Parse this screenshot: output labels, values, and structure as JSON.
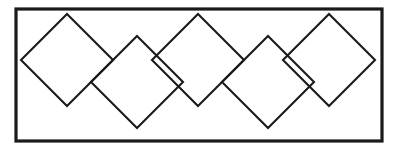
{
  "figure": {
    "canvas": {
      "width": 394,
      "height": 152,
      "background": "#ffffff"
    },
    "colors": {
      "stroke": "#1a1a1a",
      "fill": "#ffffff",
      "background": "#ffffff"
    },
    "frame": {
      "name": "outer-rectangle",
      "x": 16,
      "y": 9,
      "width": 366,
      "height": 132,
      "stroke_width": 3.2
    },
    "diamond_defaults": {
      "half_diagonal_x": 46,
      "half_diagonal_y": 46,
      "stroke_width": 2.1,
      "fill": "none"
    },
    "diamonds": [
      {
        "label": "diamond-1",
        "row": "upper",
        "cx": 67,
        "cy": 60,
        "rx": 46,
        "ry": 46
      },
      {
        "label": "diamond-2",
        "row": "lower",
        "cx": 137,
        "cy": 82,
        "rx": 46,
        "ry": 46
      },
      {
        "label": "diamond-3",
        "row": "upper",
        "cx": 198,
        "cy": 60,
        "rx": 46,
        "ry": 46
      },
      {
        "label": "diamond-4",
        "row": "lower",
        "cx": 268,
        "cy": 82,
        "rx": 46,
        "ry": 46
      },
      {
        "label": "diamond-5",
        "row": "upper",
        "cx": 329,
        "cy": 60,
        "rx": 46,
        "ry": 46
      }
    ],
    "counts": {
      "diamond_count": 5,
      "upper_row_count": 3,
      "lower_row_count": 2
    }
  }
}
